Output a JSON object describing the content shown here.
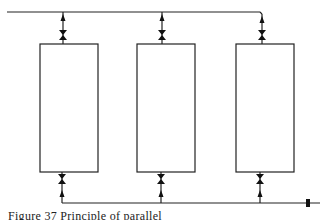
{
  "figure": {
    "caption": "Figure 37  Principle of parallel",
    "columns": [
      {
        "id": "column-1",
        "x": 40
      },
      {
        "id": "column-2",
        "x": 136
      },
      {
        "id": "column-3",
        "x": 234
      }
    ]
  }
}
